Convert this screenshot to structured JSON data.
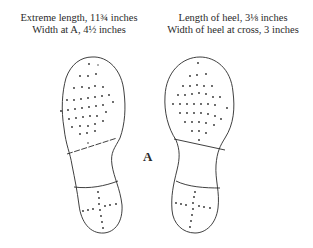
{
  "captions": {
    "left": {
      "line1": "Extreme length, 11¾ inches",
      "line2": "Width at A, 4½ inches"
    },
    "right": {
      "line1": "Length of heel, 3⅛ inches",
      "line2": "Width of heel at cross, 3 inches"
    }
  },
  "figure": {
    "center_label": "A",
    "soles": [
      {
        "id": "left-sole",
        "pattern_forefoot": "scattered nail dots",
        "pattern_heel": "dotted cross"
      },
      {
        "id": "right-sole",
        "pattern_forefoot": "scattered nail dots",
        "pattern_heel": "dotted cross"
      }
    ],
    "colors": {
      "ink": "#2a2a2a",
      "background": "#ffffff"
    }
  }
}
